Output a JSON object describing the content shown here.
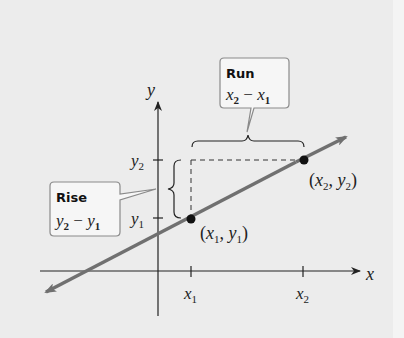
{
  "diagram": {
    "type": "slope-rise-run",
    "axes": {
      "x_label": "x",
      "y_label": "y",
      "x_ticks": [
        {
          "base": "x",
          "sub": "1"
        },
        {
          "base": "x",
          "sub": "2"
        }
      ],
      "y_ticks": [
        {
          "base": "y",
          "sub": "1"
        },
        {
          "base": "y",
          "sub": "2"
        }
      ]
    },
    "points": [
      {
        "label_open": "(",
        "x": "x",
        "xsub": "1",
        "sep": ", ",
        "y": "y",
        "ysub": "1",
        "label_close": ")"
      },
      {
        "label_open": "(",
        "x": "x",
        "xsub": "2",
        "sep": ", ",
        "y": "y",
        "ysub": "2",
        "label_close": ")"
      }
    ],
    "callouts": {
      "run": {
        "title": "Run",
        "expr_a": "x",
        "expr_a_sub": "2",
        "op": " − ",
        "expr_b": "x",
        "expr_b_sub": "1"
      },
      "rise": {
        "title": "Rise",
        "expr_a": "y",
        "expr_a_sub": "2",
        "op": " − ",
        "expr_b": "y",
        "expr_b_sub": "1"
      }
    },
    "colors": {
      "background": "#ececec",
      "line": "#707070",
      "axis": "#222222",
      "point": "#111111",
      "callout_border": "#8a8a8a",
      "callout_fill": "#f6f6f6"
    }
  }
}
